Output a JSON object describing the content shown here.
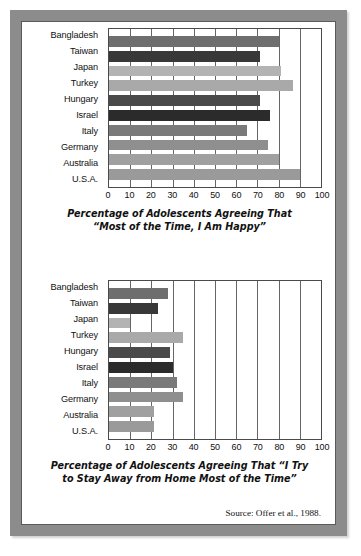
{
  "figure": {
    "source_note": "Source: Offer et al., 1988.",
    "countries": [
      "Bangladesh",
      "Taiwan",
      "Japan",
      "Turkey",
      "Hungary",
      "Israel",
      "Italy",
      "Germany",
      "Australia",
      "U.S.A."
    ],
    "bar_colors": [
      "#6e6e6e",
      "#383838",
      "#b3b3b3",
      "#a9a9a9",
      "#4a4a4a",
      "#2b2b2b",
      "#7a7a7a",
      "#8f8f8f",
      "#a0a0a0",
      "#9a9a9a"
    ],
    "frame_color": "#8c8c8c",
    "axis_ticks": [
      "0",
      "10",
      "20",
      "30",
      "40",
      "50",
      "60",
      "70",
      "80",
      "90",
      "100"
    ]
  },
  "chart_data": [
    {
      "type": "bar",
      "orientation": "horizontal",
      "title": "Percentage of Adolescents Agreeing That “Most of the Time, I Am Happy”",
      "title_line1": "Percentage of Adolescents Agreeing That",
      "title_line2": "“Most of the Time, I Am Happy”",
      "categories": [
        "Bangladesh",
        "Taiwan",
        "Japan",
        "Turkey",
        "Hungary",
        "Israel",
        "Italy",
        "Germany",
        "Australia",
        "U.S.A."
      ],
      "values": [
        80,
        71,
        81,
        87,
        71,
        76,
        65,
        75,
        80,
        90
      ],
      "xlabel": "",
      "ylabel": "",
      "xlim": [
        0,
        100
      ],
      "xticks": [
        0,
        10,
        20,
        30,
        40,
        50,
        60,
        70,
        80,
        90,
        100
      ],
      "grid": true,
      "legend": "none"
    },
    {
      "type": "bar",
      "orientation": "horizontal",
      "title": "Percentage of Adolescents Agreeing That “I Try to Stay Away from Home Most of the Time”",
      "title_line1": "Percentage of Adolescents Agreeing That “I Try",
      "title_line2": "to Stay Away from Home Most of the Time”",
      "categories": [
        "Bangladesh",
        "Taiwan",
        "Japan",
        "Turkey",
        "Hungary",
        "Israel",
        "Italy",
        "Germany",
        "Australia",
        "U.S.A."
      ],
      "values": [
        28,
        23,
        10,
        35,
        29,
        30,
        32,
        35,
        21,
        21
      ],
      "xlabel": "",
      "ylabel": "",
      "xlim": [
        0,
        100
      ],
      "xticks": [
        0,
        10,
        20,
        30,
        40,
        50,
        60,
        70,
        80,
        90,
        100
      ],
      "grid": true,
      "legend": "none"
    }
  ]
}
